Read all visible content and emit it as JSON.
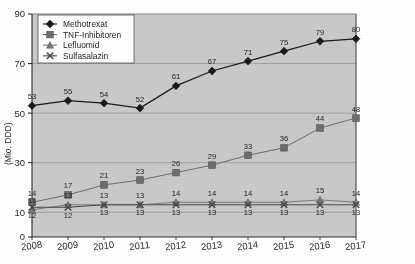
{
  "chart_data": {
    "type": "line",
    "title": "",
    "xlabel": "",
    "ylabel": "(Mio. DDD)",
    "categories": [
      "2008",
      "2009",
      "2010",
      "2011",
      "2012",
      "2013",
      "2014",
      "2015",
      "2016",
      "2017"
    ],
    "x": [
      2008,
      2009,
      2010,
      2011,
      2012,
      2013,
      2014,
      2015,
      2016,
      2017
    ],
    "ylim": [
      0,
      90
    ],
    "yticks": [
      0,
      10,
      30,
      50,
      70,
      90
    ],
    "ytick_labels": [
      "0",
      "10",
      "30",
      "50",
      "70",
      "90"
    ],
    "grid": true,
    "legend_position": "top-left",
    "plot_background": "#c9c9c9",
    "series": [
      {
        "name": "Methotrexat",
        "marker": "diamond",
        "color": "#1a1a1a",
        "label_position": "above",
        "values": [
          53,
          55,
          54,
          52,
          61,
          67,
          71,
          75,
          79,
          80
        ],
        "labels": [
          "53",
          "55",
          "54",
          "52",
          "61",
          "67",
          "71",
          "75",
          "79",
          "80"
        ]
      },
      {
        "name": "TNF-Inhibitoren",
        "marker": "square",
        "color": "#6e6e6e",
        "label_position": "above",
        "values": [
          14,
          17,
          21,
          23,
          26,
          29,
          33,
          36,
          44,
          48
        ],
        "labels": [
          "14",
          "17",
          "21",
          "23",
          "26",
          "29",
          "33",
          "36",
          "44",
          "48"
        ]
      },
      {
        "name": "Lefluomid",
        "marker": "triangle",
        "color": "#7a7a7a",
        "label_position": "above",
        "values": [
          11,
          13,
          13,
          13,
          14,
          14,
          14,
          14,
          15,
          14
        ],
        "labels": [
          "11",
          "13",
          "13",
          "13",
          "14",
          "14",
          "14",
          "14",
          "15",
          "14"
        ]
      },
      {
        "name": "Sulfasalazin",
        "marker": "cross",
        "color": "#4a4a4a",
        "label_position": "below",
        "values": [
          12,
          12,
          13,
          13,
          13,
          13,
          13,
          13,
          13,
          13
        ],
        "labels": [
          "12",
          "12",
          "13",
          "13",
          "13",
          "13",
          "13",
          "13",
          "13",
          "13"
        ]
      }
    ]
  },
  "legend": {
    "items": [
      {
        "label": "Methotrexat"
      },
      {
        "label": "TNF-Inhibitoren"
      },
      {
        "label": "Lefluomid"
      },
      {
        "label": "Sulfasalazin"
      }
    ]
  },
  "axes": {
    "y_title": "(Mio. DDD)",
    "y_ticks": [
      "90",
      "70",
      "50",
      "30",
      "10",
      "0"
    ],
    "x_ticks": [
      "2008",
      "2009",
      "2010",
      "2011",
      "2012",
      "2013",
      "2014",
      "2015",
      "2016",
      "2017"
    ]
  }
}
